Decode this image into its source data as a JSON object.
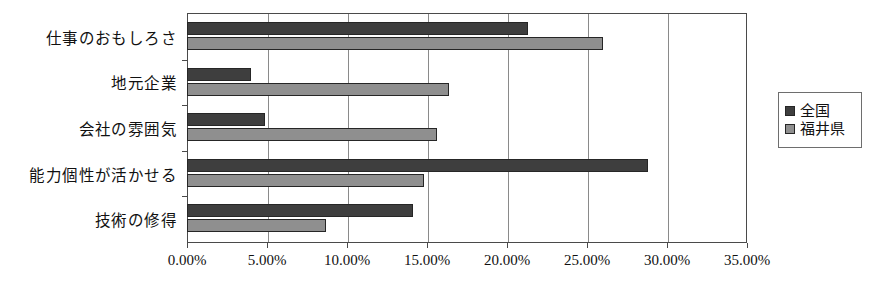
{
  "chart_data": {
    "type": "bar",
    "orientation": "horizontal",
    "title": "",
    "xlabel": "",
    "ylabel": "",
    "categories": [
      "仕事のおもしろさ",
      "地元企業",
      "会社の雰囲気",
      "能力個性が活かせる",
      "技術の修得"
    ],
    "series": [
      {
        "name": "全国",
        "color": "#3e3e3e",
        "values": [
          21.3,
          4.0,
          4.9,
          28.8,
          14.1
        ]
      },
      {
        "name": "福井県",
        "color": "#8f8f8f",
        "values": [
          26.0,
          16.4,
          15.6,
          14.8,
          8.7
        ]
      }
    ],
    "xlim": [
      0,
      35
    ],
    "xticks": [
      0,
      5,
      10,
      15,
      20,
      25,
      30,
      35
    ],
    "xtick_labels": [
      "0.00%",
      "5.00%",
      "10.00%",
      "15.00%",
      "20.00%",
      "25.00%",
      "30.00%",
      "35.00%"
    ],
    "grid": true,
    "grid_axis": "x",
    "legend_position": "right"
  },
  "legend": {
    "items": [
      {
        "label": "全国",
        "swatch": "national"
      },
      {
        "label": "福井県",
        "swatch": "fukui"
      }
    ]
  },
  "colors": {
    "national": "#3e3e3e",
    "fukui": "#8f8f8f",
    "axis": "#4a4a4a",
    "grid": "#8a8a8a",
    "background": "#ffffff"
  }
}
